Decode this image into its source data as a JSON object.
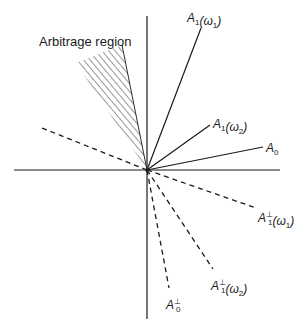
{
  "diagram": {
    "title": "",
    "colors": {
      "ink": "#1a1a1a",
      "background": "#ffffff"
    },
    "origin": {
      "x": 147,
      "y": 170
    },
    "axes": {
      "horizontal": {
        "x1": 14,
        "x2": 280,
        "y": 170
      },
      "vertical": {
        "x": 147,
        "y1": 16,
        "y2": 319
      }
    },
    "region": {
      "label": "Arbitrage region",
      "label_pos": {
        "x": 39,
        "y": 46
      },
      "pattern": "diagonal-hatch",
      "vertices": [
        [
          147,
          170
        ],
        [
          76,
          63
        ],
        [
          122,
          45
        ]
      ]
    },
    "vectors": [
      {
        "id": "A1_w1",
        "style": "solid",
        "end": [
          201,
          28
        ],
        "label_main": "A",
        "label_sub": "1",
        "label_sup": "",
        "label_arg": "(ω",
        "label_arg_sub": "1",
        "label_close": ")",
        "label_pos": {
          "x": 187,
          "y": 22
        }
      },
      {
        "id": "A1_w2",
        "style": "solid",
        "end": [
          210,
          125
        ],
        "label_main": "A",
        "label_sub": "1",
        "label_sup": "",
        "label_arg": "(ω",
        "label_arg_sub": "2",
        "label_close": ")",
        "label_pos": {
          "x": 213,
          "y": 128
        }
      },
      {
        "id": "A0",
        "style": "solid",
        "end": [
          263,
          147
        ],
        "label_main": "A",
        "label_sub": "0",
        "label_sup": "",
        "label_arg": "",
        "label_arg_sub": "",
        "label_close": "",
        "label_pos": {
          "x": 266,
          "y": 152
        }
      },
      {
        "id": "upper_left_dashed",
        "style": "dashed",
        "end": [
          42,
          128
        ],
        "label_main": "",
        "label_sub": "",
        "label_sup": "",
        "label_arg": "",
        "label_arg_sub": "",
        "label_close": "",
        "label_pos": {
          "x": 0,
          "y": 0
        }
      },
      {
        "id": "A1perp_w1",
        "style": "dashed",
        "end": [
          256,
          208
        ],
        "label_main": "A",
        "label_sub": "1",
        "label_sup": "⊥",
        "label_arg": "(ω",
        "label_arg_sub": "1",
        "label_close": ")",
        "label_pos": {
          "x": 258,
          "y": 222
        }
      },
      {
        "id": "A1perp_w2",
        "style": "dashed",
        "end": [
          213,
          269
        ],
        "label_main": "A",
        "label_sub": "1",
        "label_sup": "⊥",
        "label_arg": "(ω",
        "label_arg_sub": "2",
        "label_close": ")",
        "label_pos": {
          "x": 211,
          "y": 290
        }
      },
      {
        "id": "A0perp",
        "style": "dashed",
        "end": [
          169,
          288
        ],
        "label_main": "A",
        "label_sub": "0",
        "label_sup": "⊥",
        "label_arg": "",
        "label_arg_sub": "",
        "label_close": "",
        "label_pos": {
          "x": 166,
          "y": 309
        }
      }
    ]
  }
}
